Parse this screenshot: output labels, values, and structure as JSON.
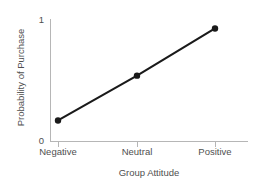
{
  "chart_data": {
    "type": "line",
    "title": "",
    "subtitle": "",
    "xlabel": "Group Attitude",
    "ylabel": "Probability of Purchase",
    "categories": [
      "Negative",
      "Neutral",
      "Positive"
    ],
    "values": [
      0.17,
      0.54,
      0.93
    ],
    "series": [
      {
        "name": "Probability of Purchase",
        "values": [
          0.17,
          0.54,
          0.93
        ]
      }
    ],
    "ylim": [
      0,
      1
    ],
    "ytick_labels": [
      "0",
      "1"
    ],
    "ytick_values": [
      0,
      1
    ],
    "xtick_labels": [
      "Negative",
      "Neutral",
      "Positive"
    ],
    "grid": false,
    "legend": false,
    "legend_position": "none",
    "marker": "filled-circle",
    "annotations": [],
    "colors": {
      "line": "#1a1a1a",
      "marker": "#1a1a1a",
      "axis": "#b6b6b6",
      "tick": "#b6b6b6",
      "text": "#4f4f4f",
      "background": "#ffffff"
    }
  },
  "axes": {
    "y": {
      "top_label": "1",
      "bottom_label": "0",
      "title": "Probability of Purchase"
    },
    "x": {
      "tick_0": "Negative",
      "tick_1": "Neutral",
      "tick_2": "Positive",
      "title": "Group Attitude"
    }
  }
}
